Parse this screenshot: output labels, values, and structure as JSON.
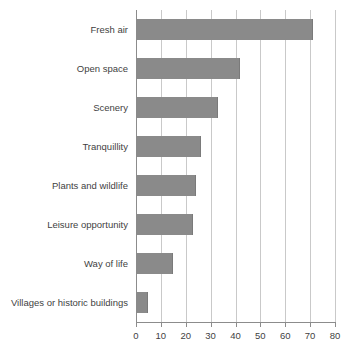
{
  "chart_data": {
    "type": "bar",
    "orientation": "horizontal",
    "title": "",
    "subtitle": "",
    "xlabel": "",
    "ylabel": "",
    "xlim": [
      0,
      80
    ],
    "ylim": null,
    "grid": true,
    "grid_axis": "x",
    "legend": false,
    "legend_position": "none",
    "bar_color": "#8a8a8a",
    "gridline_color": "#c9c9c9",
    "axis_color": "#8c8c8c",
    "background_color": "#ffffff",
    "categories": [
      "Fresh air",
      "Open space",
      "Scenery",
      "Tranquillity",
      "Plants and wildlife",
      "Leisure opportunity",
      "Way of life",
      "Villages or historic buildings"
    ],
    "values": [
      71,
      42,
      33,
      26,
      24,
      23,
      15,
      5
    ],
    "xticks": [
      0,
      10,
      20,
      30,
      40,
      50,
      60,
      70,
      80
    ],
    "xtick_labels": [
      "0",
      "10",
      "20",
      "30",
      "40",
      "50",
      "60",
      "70",
      "80"
    ]
  }
}
